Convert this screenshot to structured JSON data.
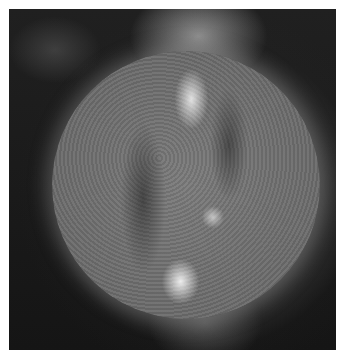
{
  "image": {
    "subject": "Sun disk in extreme ultraviolet, grayscale",
    "alt": "Grayscale extreme-ultraviolet image of the Sun showing a mottled disk with bright active regions near the top and bottom and a faint corona",
    "colors": {
      "background": "#ffffff",
      "sky": "#1a1a1a",
      "disk": "#7a7a7a",
      "bright": "#f0f0f0"
    }
  }
}
